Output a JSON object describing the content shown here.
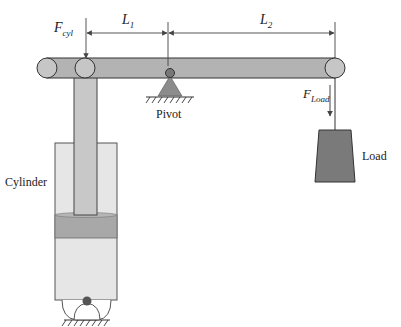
{
  "diagram": {
    "labels": {
      "f_cyl_main": "F",
      "f_cyl_sub": "cyl",
      "l1_main": "L",
      "l1_sub": "1",
      "l2_main": "L",
      "l2_sub": "2",
      "f_load_main": "F",
      "f_load_sub": "Load",
      "pivot": "Pivot",
      "load": "Load",
      "cylinder": "Cylinder"
    },
    "colors": {
      "beam": "#b3b3b3",
      "rod": "#c4c4c4",
      "cylinder_body": "#e6e6e6",
      "piston": "#a6a6a6",
      "load": "#7a7a7a",
      "pivot": "#8c8c8c",
      "stroke": "#333333"
    }
  }
}
